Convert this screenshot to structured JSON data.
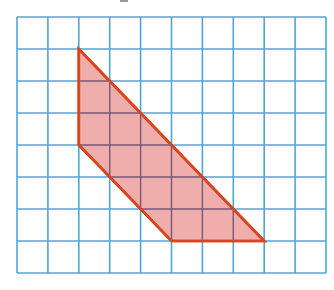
{
  "diagram": {
    "type": "grid-polygon",
    "grid": {
      "columns": 10,
      "rows": 8,
      "origin_px": [
        17,
        17
      ],
      "cell_w": 30.9,
      "cell_h": 32,
      "line_color": "#4aa8d8"
    },
    "shape": {
      "vertices_grid": [
        [
          2,
          1
        ],
        [
          2,
          4
        ],
        [
          5,
          7
        ],
        [
          8,
          7
        ]
      ],
      "fill_color": "#eda5a3",
      "stroke_color": "#d9461d"
    },
    "top_artifact_color": "#9a9a9a"
  }
}
